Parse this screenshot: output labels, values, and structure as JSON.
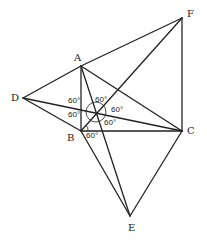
{
  "diagram": {
    "points": {
      "A": {
        "label": "A",
        "x": 81,
        "y": 66
      },
      "B": {
        "label": "B",
        "x": 81,
        "y": 131
      },
      "C": {
        "label": "C",
        "x": 182,
        "y": 131
      },
      "D": {
        "label": "D",
        "x": 23,
        "y": 98
      },
      "E": {
        "label": "E",
        "x": 130,
        "y": 216
      },
      "F": {
        "label": "F",
        "x": 182,
        "y": 18
      },
      "O": {
        "label": "",
        "x": 96,
        "y": 112
      }
    },
    "segments": [
      [
        "A",
        "B"
      ],
      [
        "B",
        "C"
      ],
      [
        "C",
        "A"
      ],
      [
        "D",
        "A"
      ],
      [
        "D",
        "B"
      ],
      [
        "A",
        "F"
      ],
      [
        "F",
        "C"
      ],
      [
        "B",
        "E"
      ],
      [
        "E",
        "C"
      ],
      [
        "A",
        "E"
      ],
      [
        "D",
        "C"
      ],
      [
        "B",
        "F"
      ]
    ],
    "angle_labels": [
      {
        "text": "60°",
        "x": 67,
        "y": 97
      },
      {
        "text": "60°",
        "x": 67,
        "y": 113
      },
      {
        "text": "60°",
        "x": 95,
        "y": 97
      },
      {
        "text": "60°",
        "x": 110,
        "y": 106
      },
      {
        "text": "60°",
        "x": 103,
        "y": 120
      },
      {
        "text": "60°",
        "x": 85,
        "y": 132
      }
    ]
  }
}
